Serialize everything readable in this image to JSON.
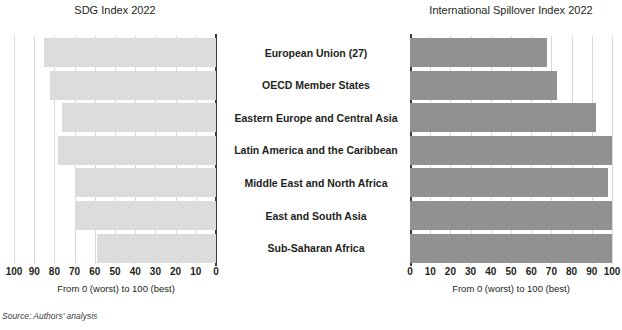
{
  "source_note": "Source: Authors' analysis",
  "axis_caption": "From 0 (worst) to 100 (best)",
  "colors": {
    "bar_left": "#dcdcdc",
    "bar_right": "#919191",
    "axis": "#3b3b3b",
    "grid": "#d9d9d9",
    "text": "#231f20"
  },
  "categories": [
    "European Union (27)",
    "OECD Member States",
    "Eastern Europe and Central Asia",
    "Latin America and the Caribbean",
    "Middle East and North Africa",
    "East and South Asia",
    "Sub-Saharan Africa"
  ],
  "ticks": {
    "left": [
      "100",
      "90",
      "80",
      "70",
      "60",
      "50",
      "40",
      "30",
      "20",
      "10",
      "0"
    ],
    "right": [
      "0",
      "10",
      "20",
      "30",
      "40",
      "50",
      "60",
      "70",
      "80",
      "90",
      "100"
    ]
  },
  "chart_data": [
    {
      "type": "bar",
      "title": "SDG Index 2022",
      "orientation": "horizontal",
      "direction": "right-to-left",
      "xlabel": "From 0 (worst) to 100 (best)",
      "ylabel": "",
      "xlim": [
        0,
        100
      ],
      "grid": true,
      "legend": "none",
      "categories": [
        "European Union (27)",
        "OECD Member States",
        "Eastern Europe and Central Asia",
        "Latin America and the Caribbean",
        "Middle East and North Africa",
        "East and South Asia",
        "Sub-Saharan Africa"
      ],
      "values": [
        85,
        82,
        76,
        78,
        70,
        70,
        59
      ],
      "tick_labels": [
        "100",
        "90",
        "80",
        "70",
        "60",
        "50",
        "40",
        "30",
        "20",
        "10",
        "0"
      ],
      "color": "#dcdcdc"
    },
    {
      "type": "bar",
      "title": "International Spillover Index 2022",
      "orientation": "horizontal",
      "direction": "left-to-right",
      "xlabel": "From 0 (worst) to 100 (best)",
      "ylabel": "",
      "xlim": [
        0,
        100
      ],
      "grid": true,
      "legend": "none",
      "categories": [
        "European Union (27)",
        "OECD Member States",
        "Eastern Europe and Central Asia",
        "Latin America and the Caribbean",
        "Middle East and North Africa",
        "East and South Asia",
        "Sub-Saharan Africa"
      ],
      "values": [
        68,
        73,
        92,
        100,
        98,
        101,
        101
      ],
      "tick_labels": [
        "0",
        "10",
        "20",
        "30",
        "40",
        "50",
        "60",
        "70",
        "80",
        "90",
        "100"
      ],
      "color": "#919191"
    }
  ]
}
